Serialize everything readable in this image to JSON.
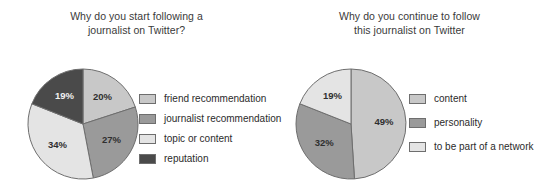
{
  "chart_data": [
    {
      "type": "pie",
      "title": "Why do you start following a journalist on Twitter?",
      "title_lines": [
        "Why do you start following a",
        "journalist on Twitter?"
      ],
      "legend_position": "right",
      "start_angle_deg": 0,
      "direction": "clockwise",
      "categories": [
        "friend recommendation",
        "journalist recommendation",
        "topic or content",
        "reputation"
      ],
      "values": [
        20,
        27,
        34,
        19
      ],
      "value_labels": [
        "20%",
        "27%",
        "34%",
        "19%"
      ],
      "colors": [
        "#c8c8c8",
        "#9a9a9a",
        "#e4e4e4",
        "#4a4a4a"
      ],
      "stroke_color": "#6e6e6e",
      "xlabel": "",
      "ylabel": ""
    },
    {
      "type": "pie",
      "title": "Why do you continue to follow this journalist on Twitter",
      "title_lines": [
        "Why do you continue to follow",
        "this journalist on Twitter"
      ],
      "legend_position": "right",
      "start_angle_deg": 0,
      "direction": "clockwise",
      "categories": [
        "content",
        "personality",
        "to be part of a network"
      ],
      "values": [
        49,
        32,
        19
      ],
      "value_labels": [
        "49%",
        "32%",
        "19%"
      ],
      "colors": [
        "#c8c8c8",
        "#9a9a9a",
        "#e4e4e4"
      ],
      "stroke_color": "#6e6e6e",
      "xlabel": "",
      "ylabel": ""
    }
  ],
  "panels": [
    {
      "title_line1": "Why do you start following a",
      "title_line2": "journalist on Twitter?",
      "legend": [
        {
          "label": "friend recommendation"
        },
        {
          "label": "journalist recommendation"
        },
        {
          "label": "topic or content"
        },
        {
          "label": "reputation"
        }
      ]
    },
    {
      "title_line1": "Why do you continue to follow",
      "title_line2": "this journalist on Twitter",
      "legend": [
        {
          "label": "content"
        },
        {
          "label": "personality"
        },
        {
          "label": "to be part of a network"
        }
      ]
    }
  ]
}
